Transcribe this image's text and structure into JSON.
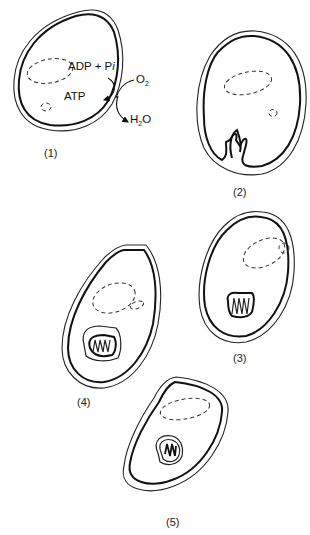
{
  "figure": {
    "panels": [
      {
        "id": 1,
        "label": "(1)",
        "description": "Cell with oxidative phosphorylation at plasma membrane"
      },
      {
        "id": 2,
        "label": "(2)",
        "description": "Plasma membrane invaginating into cristae-like folds"
      },
      {
        "id": 3,
        "label": "(3)",
        "description": "Folded membrane region pinching off inward"
      },
      {
        "id": 4,
        "label": "(4)",
        "description": "Enclosed double-membrane compartment with cristae"
      },
      {
        "id": 5,
        "label": "(5)",
        "description": "Mitochondrion-like organelle in cell interior"
      }
    ],
    "annotations": {
      "reactants": "ADP + P",
      "reactant_italic": "i",
      "product": "ATP",
      "oxygen": "O",
      "oxygen_sub": "2",
      "water_h": "H",
      "water_sub": "2",
      "water_o": "O"
    }
  }
}
